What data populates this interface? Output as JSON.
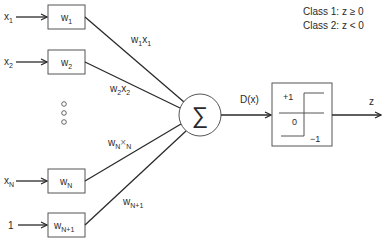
{
  "diagram": {
    "type": "perceptron",
    "legend": {
      "class1": "Class 1: z  ≥ 0",
      "class2": "Class 2: z  < 0"
    },
    "inputs": [
      {
        "label": "x",
        "sub": "1",
        "weight": "w",
        "weight_sub": "1",
        "product": "w",
        "product_sub1": "1",
        "product_x": "x",
        "product_sub2": "1"
      },
      {
        "label": "x",
        "sub": "2",
        "weight": "w",
        "weight_sub": "2",
        "product": "w",
        "product_sub1": "2",
        "product_x": "x",
        "product_sub2": "2"
      },
      {
        "label": "x",
        "sub": "N",
        "weight": "w",
        "weight_sub": "N",
        "product": "w",
        "product_sub1": "N",
        "product_x": "×",
        "product_sub2": "N"
      },
      {
        "label": "1",
        "sub": "",
        "weight": "w",
        "weight_sub": "N+1",
        "product": "w",
        "product_sub1": "N+1",
        "product_x": "",
        "product_sub2": ""
      }
    ],
    "ellipsis": "◦◦◦",
    "summation_symbol": "∑",
    "summation_output_label": "D(x)",
    "step_function": {
      "plus_one": "+1",
      "zero": "0",
      "minus_one": "−1"
    },
    "output_label": "z"
  }
}
